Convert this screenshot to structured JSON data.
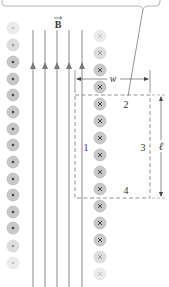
{
  "diagram": {
    "field_label": "B",
    "field_vector_arrow": "→",
    "labels": {
      "width": "w",
      "length": "ℓ",
      "side_1": "1",
      "side_2": "2",
      "side_3": "3",
      "side_4": "4"
    },
    "callout": {
      "text": ""
    },
    "left_column": {
      "direction": "out-of-page",
      "symbol": "dot",
      "count": 15
    },
    "right_column": {
      "direction": "into-page",
      "symbol": "cross",
      "count": 15
    },
    "field_lines": {
      "count": 5,
      "direction": "up"
    },
    "colors": {
      "line": "#7a7a7a",
      "circle_fill": "#c8c8c8",
      "circle_edge": "#b0b0b0",
      "symbol": "#555555",
      "dashed": "#888888",
      "text": "#333333"
    }
  }
}
